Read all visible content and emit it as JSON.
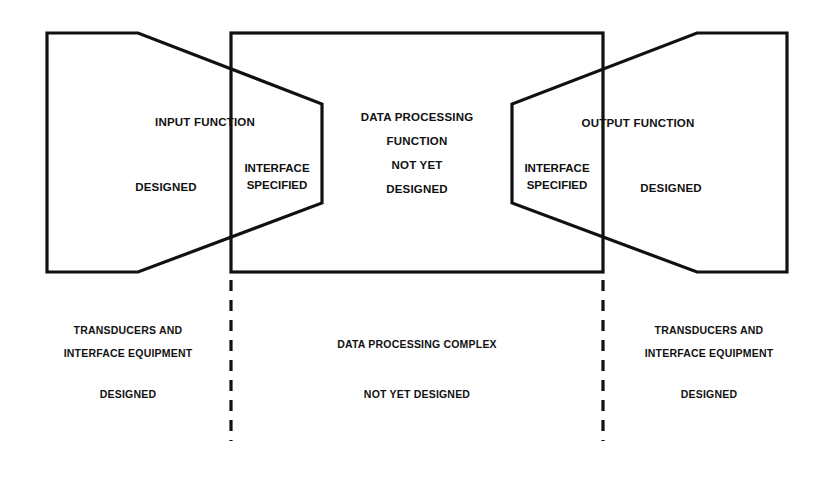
{
  "diagram": {
    "stroke_color": "#111111",
    "background_color": "#ffffff",
    "blocks": {
      "input": {
        "name": "INPUT FUNCTION",
        "status": "DESIGNED"
      },
      "interface_left": {
        "line1": "INTERFACE",
        "line2": "SPECIFIED"
      },
      "data_processing": {
        "line1": "DATA PROCESSING",
        "line2": "FUNCTION",
        "line3": "NOT YET",
        "line4": "DESIGNED"
      },
      "interface_right": {
        "line1": "INTERFACE",
        "line2": "SPECIFIED"
      },
      "output": {
        "name": "OUTPUT FUNCTION",
        "status": "DESIGNED"
      }
    },
    "bottom_labels": {
      "left": {
        "line1": "TRANSDUCERS AND",
        "line2": "INTERFACE EQUIPMENT",
        "status": "DESIGNED"
      },
      "center": {
        "line1": "DATA PROCESSING COMPLEX",
        "status": "NOT YET DESIGNED"
      },
      "right": {
        "line1": "TRANSDUCERS AND",
        "line2": "INTERFACE EQUIPMENT",
        "status": "DESIGNED"
      }
    }
  }
}
